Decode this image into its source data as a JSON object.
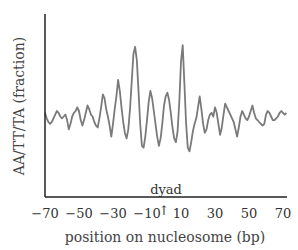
{
  "chart_data": {
    "type": "line",
    "title": "",
    "xlabel": "position on nucleosome (bp)",
    "ylabel": "AA/TT/TA (fraction)",
    "xlim": [
      -70,
      72
    ],
    "ylim": [
      0,
      1
    ],
    "x_ticks": [
      -70,
      -50,
      -30,
      -10,
      10,
      30,
      50,
      70
    ],
    "x_tick_labels": [
      "−70",
      "−50",
      "−30",
      "−10",
      "10",
      "30",
      "50",
      "70"
    ],
    "y_ticks": [],
    "grid": false,
    "legend": null,
    "annotations": [
      {
        "text": "dyad",
        "x": 0,
        "arrow": "↑"
      }
    ],
    "series": [
      {
        "name": "AA/TT/TA",
        "color": "#7a7a7a",
        "x": [
          -70,
          -69,
          -68,
          -67,
          -66,
          -65,
          -64,
          -63,
          -62,
          -61,
          -60,
          -59,
          -58,
          -57,
          -56,
          -55,
          -54,
          -53,
          -52,
          -51,
          -50,
          -49,
          -48,
          -47,
          -46,
          -45,
          -44,
          -43,
          -42,
          -41,
          -40,
          -39,
          -38,
          -37,
          -36,
          -35,
          -34,
          -33,
          -32,
          -31,
          -30,
          -29,
          -28,
          -27,
          -26,
          -25,
          -24,
          -23,
          -22,
          -21,
          -20,
          -19,
          -18,
          -17,
          -16,
          -15,
          -14,
          -13,
          -12,
          -11,
          -10,
          -9,
          -8,
          -7,
          -6,
          -5,
          -4,
          -3,
          -2,
          -1,
          0,
          1,
          2,
          3,
          4,
          5,
          6,
          7,
          8,
          9,
          10,
          11,
          12,
          13,
          14,
          15,
          16,
          17,
          18,
          19,
          20,
          21,
          22,
          23,
          24,
          25,
          26,
          27,
          28,
          29,
          30,
          31,
          32,
          33,
          34,
          35,
          36,
          37,
          38,
          39,
          40,
          41,
          42,
          43,
          44,
          45,
          46,
          47,
          48,
          49,
          50,
          51,
          52,
          53,
          54,
          55,
          56,
          57,
          58,
          59,
          60,
          61,
          62,
          63,
          64,
          65,
          66,
          67,
          68,
          69,
          70,
          71,
          72
        ],
        "values": [
          0.46,
          0.43,
          0.41,
          0.4,
          0.41,
          0.43,
          0.45,
          0.47,
          0.46,
          0.44,
          0.43,
          0.44,
          0.45,
          0.42,
          0.37,
          0.4,
          0.44,
          0.46,
          0.47,
          0.49,
          0.47,
          0.42,
          0.39,
          0.42,
          0.46,
          0.5,
          0.48,
          0.45,
          0.44,
          0.41,
          0.39,
          0.38,
          0.43,
          0.49,
          0.56,
          0.54,
          0.48,
          0.44,
          0.39,
          0.33,
          0.4,
          0.48,
          0.55,
          0.64,
          0.58,
          0.49,
          0.41,
          0.35,
          0.32,
          0.37,
          0.48,
          0.63,
          0.78,
          0.82,
          0.75,
          0.58,
          0.4,
          0.28,
          0.27,
          0.33,
          0.42,
          0.52,
          0.58,
          0.54,
          0.47,
          0.4,
          0.33,
          0.28,
          0.32,
          0.4,
          0.5,
          0.55,
          0.57,
          0.53,
          0.46,
          0.38,
          0.32,
          0.3,
          0.36,
          0.52,
          0.74,
          0.83,
          0.62,
          0.4,
          0.27,
          0.25,
          0.3,
          0.36,
          0.4,
          0.43,
          0.49,
          0.55,
          0.48,
          0.4,
          0.35,
          0.37,
          0.42,
          0.45,
          0.46,
          0.44,
          0.49,
          0.46,
          0.4,
          0.34,
          0.38,
          0.45,
          0.51,
          0.49,
          0.47,
          0.45,
          0.43,
          0.41,
          0.37,
          0.33,
          0.38,
          0.44,
          0.47,
          0.45,
          0.43,
          0.42,
          0.44,
          0.47,
          0.5,
          0.46,
          0.43,
          0.42,
          0.41,
          0.4,
          0.39,
          0.4,
          0.45,
          0.47,
          0.46,
          0.44,
          0.42,
          0.42,
          0.43,
          0.44,
          0.46,
          0.47,
          0.46,
          0.45,
          0.46
        ]
      }
    ]
  }
}
